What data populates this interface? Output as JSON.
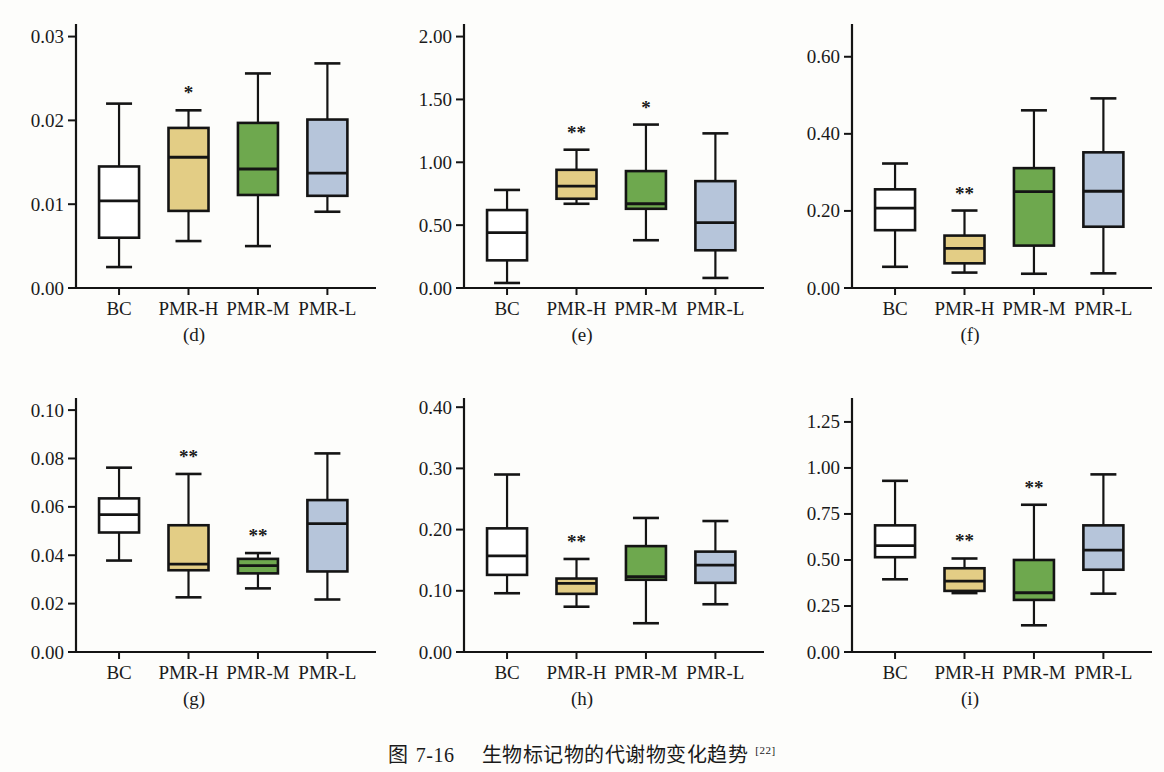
{
  "caption": {
    "prefix": "图",
    "number": "7-16",
    "title": "生物标记物的代谢物变化趋势",
    "reference": "[22]"
  },
  "colors": {
    "bc": "#ffffff",
    "pmr_h": "#e3cd85",
    "pmr_m": "#6ea84e",
    "pmr_l": "#b6c5da",
    "stroke": "#141414",
    "background": "#fdfdfb"
  },
  "categories": [
    "BC",
    "PMR-H",
    "PMR-M",
    "PMR-L"
  ],
  "chart_data": [
    {
      "type": "box",
      "panel": "(d)",
      "categories": [
        "BC",
        "PMR-H",
        "PMR-M",
        "PMR-L"
      ],
      "ylim": [
        0.0,
        0.0315
      ],
      "yticks": [
        0.0,
        0.01,
        0.02,
        0.03
      ],
      "yticklabels": [
        "0.00",
        "0.01",
        "0.02",
        "0.03"
      ],
      "boxes": [
        {
          "label": "BC",
          "fill": "#ffffff",
          "whisker_low": 0.0025,
          "q1": 0.006,
          "median": 0.0104,
          "q3": 0.0145,
          "whisker_high": 0.022,
          "significance": ""
        },
        {
          "label": "PMR-H",
          "fill": "#e3cd85",
          "whisker_low": 0.0056,
          "q1": 0.0092,
          "median": 0.0156,
          "q3": 0.0191,
          "whisker_high": 0.0212,
          "significance": "*"
        },
        {
          "label": "PMR-M",
          "fill": "#6ea84e",
          "whisker_low": 0.005,
          "q1": 0.0111,
          "median": 0.0142,
          "q3": 0.0197,
          "whisker_high": 0.0256,
          "significance": ""
        },
        {
          "label": "PMR-L",
          "fill": "#b6c5da",
          "whisker_low": 0.0091,
          "q1": 0.011,
          "median": 0.0137,
          "q3": 0.0201,
          "whisker_high": 0.0268,
          "significance": ""
        }
      ]
    },
    {
      "type": "box",
      "panel": "(e)",
      "categories": [
        "BC",
        "PMR-H",
        "PMR-M",
        "PMR-L"
      ],
      "ylim": [
        0.0,
        2.1
      ],
      "yticks": [
        0.0,
        0.5,
        1.0,
        1.5,
        2.0
      ],
      "yticklabels": [
        "0.00",
        "0.50",
        "1.00",
        "1.50",
        "2.00"
      ],
      "boxes": [
        {
          "label": "BC",
          "fill": "#ffffff",
          "whisker_low": 0.04,
          "q1": 0.22,
          "median": 0.44,
          "q3": 0.62,
          "whisker_high": 0.78,
          "significance": ""
        },
        {
          "label": "PMR-H",
          "fill": "#e3cd85",
          "whisker_low": 0.67,
          "q1": 0.71,
          "median": 0.81,
          "q3": 0.94,
          "whisker_high": 1.1,
          "significance": "**"
        },
        {
          "label": "PMR-M",
          "fill": "#6ea84e",
          "whisker_low": 0.38,
          "q1": 0.63,
          "median": 0.67,
          "q3": 0.93,
          "whisker_high": 1.3,
          "significance": "*"
        },
        {
          "label": "PMR-L",
          "fill": "#b6c5da",
          "whisker_low": 0.08,
          "q1": 0.3,
          "median": 0.52,
          "q3": 0.85,
          "whisker_high": 1.23,
          "significance": ""
        }
      ]
    },
    {
      "type": "box",
      "panel": "(f)",
      "categories": [
        "BC",
        "PMR-H",
        "PMR-M",
        "PMR-L"
      ],
      "ylim": [
        0.0,
        0.685
      ],
      "yticks": [
        0.0,
        0.2,
        0.4,
        0.6
      ],
      "yticklabels": [
        "0.00",
        "0.20",
        "0.40",
        "0.60"
      ],
      "boxes": [
        {
          "label": "BC",
          "fill": "#ffffff",
          "whisker_low": 0.055,
          "q1": 0.15,
          "median": 0.207,
          "q3": 0.256,
          "whisker_high": 0.323,
          "significance": ""
        },
        {
          "label": "PMR-H",
          "fill": "#e3cd85",
          "whisker_low": 0.04,
          "q1": 0.064,
          "median": 0.103,
          "q3": 0.136,
          "whisker_high": 0.201,
          "significance": "**"
        },
        {
          "label": "PMR-M",
          "fill": "#6ea84e",
          "whisker_low": 0.037,
          "q1": 0.11,
          "median": 0.25,
          "q3": 0.311,
          "whisker_high": 0.461,
          "significance": ""
        },
        {
          "label": "PMR-L",
          "fill": "#b6c5da",
          "whisker_low": 0.038,
          "q1": 0.159,
          "median": 0.251,
          "q3": 0.352,
          "whisker_high": 0.492,
          "significance": ""
        }
      ]
    },
    {
      "type": "box",
      "panel": "(g)",
      "categories": [
        "BC",
        "PMR-H",
        "PMR-M",
        "PMR-L"
      ],
      "ylim": [
        0.0,
        0.105
      ],
      "yticks": [
        0.0,
        0.02,
        0.04,
        0.06,
        0.08,
        0.1
      ],
      "yticklabels": [
        "0.00",
        "0.02",
        "0.04",
        "0.06",
        "0.08",
        "0.10"
      ],
      "boxes": [
        {
          "label": "BC",
          "fill": "#ffffff",
          "whisker_low": 0.0378,
          "q1": 0.0494,
          "median": 0.0568,
          "q3": 0.0635,
          "whisker_high": 0.0762,
          "significance": ""
        },
        {
          "label": "PMR-H",
          "fill": "#e3cd85",
          "whisker_low": 0.0226,
          "q1": 0.0338,
          "median": 0.0363,
          "q3": 0.0524,
          "whisker_high": 0.0736,
          "significance": "**"
        },
        {
          "label": "PMR-M",
          "fill": "#6ea84e",
          "whisker_low": 0.0263,
          "q1": 0.0325,
          "median": 0.0357,
          "q3": 0.0385,
          "whisker_high": 0.0409,
          "significance": "**"
        },
        {
          "label": "PMR-L",
          "fill": "#b6c5da",
          "whisker_low": 0.0217,
          "q1": 0.0333,
          "median": 0.0531,
          "q3": 0.0628,
          "whisker_high": 0.0821,
          "significance": ""
        }
      ]
    },
    {
      "type": "box",
      "panel": "(h)",
      "categories": [
        "BC",
        "PMR-H",
        "PMR-M",
        "PMR-L"
      ],
      "ylim": [
        0.0,
        0.415
      ],
      "yticks": [
        0.0,
        0.1,
        0.2,
        0.3,
        0.4
      ],
      "yticklabels": [
        "0.00",
        "0.10",
        "0.20",
        "0.30",
        "0.40"
      ],
      "boxes": [
        {
          "label": "BC",
          "fill": "#ffffff",
          "whisker_low": 0.096,
          "q1": 0.126,
          "median": 0.157,
          "q3": 0.202,
          "whisker_high": 0.29,
          "significance": ""
        },
        {
          "label": "PMR-H",
          "fill": "#e3cd85",
          "whisker_low": 0.074,
          "q1": 0.095,
          "median": 0.112,
          "q3": 0.12,
          "whisker_high": 0.152,
          "significance": "**"
        },
        {
          "label": "PMR-M",
          "fill": "#6ea84e",
          "whisker_low": 0.047,
          "q1": 0.118,
          "median": 0.123,
          "q3": 0.173,
          "whisker_high": 0.219,
          "significance": ""
        },
        {
          "label": "PMR-L",
          "fill": "#b6c5da",
          "whisker_low": 0.078,
          "q1": 0.113,
          "median": 0.142,
          "q3": 0.164,
          "whisker_high": 0.214,
          "significance": ""
        }
      ]
    },
    {
      "type": "box",
      "panel": "(i)",
      "categories": [
        "BC",
        "PMR-H",
        "PMR-M",
        "PMR-L"
      ],
      "ylim": [
        0.0,
        1.38
      ],
      "yticks": [
        0.0,
        0.25,
        0.5,
        0.75,
        1.0,
        1.25
      ],
      "yticklabels": [
        "0.00",
        "0.25",
        "0.50",
        "0.75",
        "1.00",
        "1.25"
      ],
      "boxes": [
        {
          "label": "BC",
          "fill": "#ffffff",
          "whisker_low": 0.395,
          "q1": 0.515,
          "median": 0.578,
          "q3": 0.688,
          "whisker_high": 0.93,
          "significance": ""
        },
        {
          "label": "PMR-H",
          "fill": "#e3cd85",
          "whisker_low": 0.32,
          "q1": 0.332,
          "median": 0.385,
          "q3": 0.455,
          "whisker_high": 0.508,
          "significance": "**"
        },
        {
          "label": "PMR-M",
          "fill": "#6ea84e",
          "whisker_low": 0.145,
          "q1": 0.283,
          "median": 0.322,
          "q3": 0.5,
          "whisker_high": 0.8,
          "significance": "**"
        },
        {
          "label": "PMR-L",
          "fill": "#b6c5da",
          "whisker_low": 0.317,
          "q1": 0.447,
          "median": 0.553,
          "q3": 0.688,
          "whisker_high": 0.965,
          "significance": ""
        }
      ]
    }
  ]
}
